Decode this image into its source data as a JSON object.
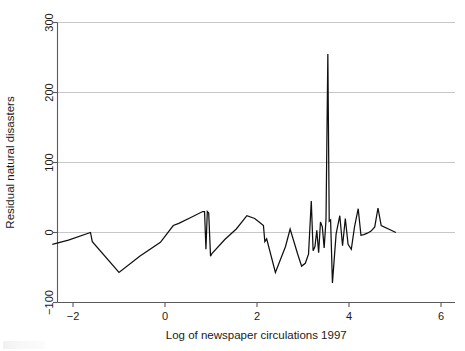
{
  "chart_data": {
    "type": "line",
    "title": "",
    "xlabel": "Log of newspaper circulations 1997",
    "ylabel": "Residual natural disasters",
    "xlim": [
      -2.6,
      6.2
    ],
    "ylim": [
      -100,
      300
    ],
    "xticks": [
      -2,
      0,
      2,
      4,
      6
    ],
    "xticklabels": [
      "−2",
      "0",
      "2",
      "4",
      "6"
    ],
    "yticks": [
      -100,
      0,
      100,
      200,
      300
    ],
    "yticklabels": [
      "−100",
      "0",
      "100",
      "200",
      "300"
    ],
    "grid": "horizontal",
    "legend": "none",
    "series": [
      {
        "name": "Residual natural disasters",
        "x": [
          -2.45,
          -2.1,
          -1.62,
          -1.58,
          -1.0,
          -0.55,
          -0.1,
          0.18,
          0.3,
          0.55,
          0.82,
          0.86,
          0.89,
          0.92,
          0.95,
          0.99,
          1.02,
          1.3,
          1.55,
          1.78,
          1.95,
          2.1,
          2.14,
          2.17,
          2.21,
          2.4,
          2.62,
          2.72,
          2.88,
          2.97,
          3.05,
          3.12,
          3.18,
          3.22,
          3.26,
          3.3,
          3.34,
          3.38,
          3.42,
          3.46,
          3.5,
          3.54,
          3.57,
          3.6,
          3.64,
          3.72,
          3.8,
          3.86,
          3.92,
          3.98,
          4.05,
          4.12,
          4.2,
          4.26,
          4.32,
          4.4,
          4.48,
          4.56,
          4.63,
          4.7,
          5.02
        ],
        "y": [
          -17,
          -11,
          0,
          -13,
          -57,
          -34,
          -14,
          10,
          13,
          21,
          30,
          30,
          -24,
          30,
          28,
          -34,
          -30,
          -10,
          5,
          24,
          20,
          12,
          10,
          -13,
          -9,
          -57,
          -20,
          5,
          -30,
          -48,
          -44,
          -31,
          45,
          -26,
          -20,
          3,
          -29,
          15,
          8,
          -22,
          18,
          255,
          16,
          18,
          -72,
          -2,
          24,
          -19,
          20,
          -17,
          -24,
          8,
          34,
          -4,
          -3,
          -1,
          2,
          8,
          35,
          10,
          0
        ]
      }
    ]
  },
  "axis": {
    "x_title": "Log of newspaper circulations 1997",
    "y_title": "Residual natural disasters"
  }
}
